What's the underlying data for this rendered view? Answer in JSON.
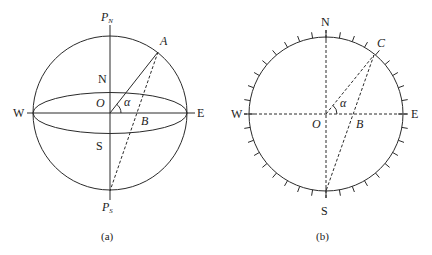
{
  "figure_a": {
    "caption": "(a)",
    "labels": {
      "pole_north": "P",
      "pole_north_sub": "N",
      "pole_south": "P",
      "pole_south_sub": "S",
      "north": "N",
      "south": "S",
      "west": "W",
      "east": "E",
      "origin": "O",
      "point_a": "A",
      "point_b": "B",
      "angle": "α"
    }
  },
  "figure_b": {
    "caption": "(b)",
    "labels": {
      "north": "N",
      "south": "S",
      "west": "W",
      "east": "E",
      "origin": "O",
      "point_c": "C",
      "point_b": "B",
      "angle": "α"
    },
    "tick_interval_deg": 10
  },
  "colors": {
    "line": "#2a2a2a",
    "background": "#ffffff"
  }
}
